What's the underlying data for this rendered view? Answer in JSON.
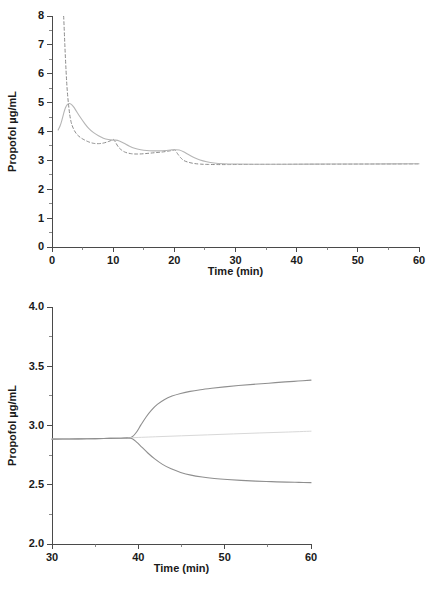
{
  "figure": {
    "background": "#ffffff",
    "width": 427,
    "height": 590
  },
  "chart_data": [
    {
      "id": "panel-a",
      "type": "line",
      "title": "",
      "xlabel": "Time (min)",
      "ylabel": "Propofol µg/mL",
      "xlim": [
        0,
        60
      ],
      "ylim": [
        0,
        8
      ],
      "xticks": [
        0,
        10,
        20,
        30,
        40,
        50,
        60
      ],
      "xtick_labels": [
        "0",
        "10",
        "20",
        "30",
        "40",
        "50",
        "60"
      ],
      "xminor_step": 5,
      "yticks": [
        0,
        1,
        2,
        3,
        4,
        5,
        6,
        7,
        8
      ],
      "ytick_labels": [
        "0",
        "1",
        "2",
        "3",
        "4",
        "5",
        "6",
        "7",
        "8"
      ],
      "yminor_step": 0.5,
      "grid": false,
      "legend": "none",
      "series": [
        {
          "name": "plasma-concentration",
          "style": "dashed",
          "color": "#8c8c8c",
          "dash": "3,2.5",
          "width": 1.0,
          "points": [
            [
              0.6,
              8.6
            ],
            [
              1.0,
              9.4
            ],
            [
              1.3,
              9.6
            ],
            [
              1.6,
              9.0
            ],
            [
              1.9,
              8.0
            ],
            [
              2.1,
              7.0
            ],
            [
              2.3,
              6.1
            ],
            [
              2.5,
              5.4
            ],
            [
              2.8,
              4.75
            ],
            [
              3.1,
              4.35
            ],
            [
              3.5,
              4.1
            ],
            [
              4.0,
              3.92
            ],
            [
              4.6,
              3.8
            ],
            [
              5.2,
              3.72
            ],
            [
              6.0,
              3.64
            ],
            [
              6.8,
              3.59
            ],
            [
              7.6,
              3.58
            ],
            [
              8.4,
              3.6
            ],
            [
              9.2,
              3.65
            ],
            [
              9.8,
              3.7
            ],
            [
              10.1,
              3.72
            ],
            [
              10.4,
              3.62
            ],
            [
              10.8,
              3.48
            ],
            [
              11.3,
              3.37
            ],
            [
              12.0,
              3.28
            ],
            [
              13.0,
              3.23
            ],
            [
              14.0,
              3.22
            ],
            [
              15.0,
              3.23
            ],
            [
              16.0,
              3.25
            ],
            [
              17.0,
              3.27
            ],
            [
              18.0,
              3.29
            ],
            [
              19.0,
              3.32
            ],
            [
              19.8,
              3.35
            ],
            [
              20.1,
              3.36
            ],
            [
              20.5,
              3.24
            ],
            [
              21.0,
              3.1
            ],
            [
              21.6,
              2.99
            ],
            [
              22.4,
              2.93
            ],
            [
              23.3,
              2.89
            ],
            [
              24.3,
              2.87
            ],
            [
              25.5,
              2.86
            ],
            [
              27.0,
              2.855
            ],
            [
              29.0,
              2.855
            ],
            [
              32.0,
              2.86
            ],
            [
              36.0,
              2.862
            ],
            [
              42.0,
              2.866
            ],
            [
              50.0,
              2.872
            ],
            [
              60.0,
              2.88
            ]
          ]
        },
        {
          "name": "effect-site-concentration",
          "style": "solid",
          "color": "#b5b5b5",
          "width": 1.1,
          "points": [
            [
              1.0,
              4.05
            ],
            [
              1.3,
              4.18
            ],
            [
              1.6,
              4.38
            ],
            [
              1.9,
              4.62
            ],
            [
              2.2,
              4.82
            ],
            [
              2.5,
              4.93
            ],
            [
              2.8,
              4.97
            ],
            [
              3.1,
              4.95
            ],
            [
              3.5,
              4.86
            ],
            [
              4.0,
              4.7
            ],
            [
              4.6,
              4.5
            ],
            [
              5.3,
              4.29
            ],
            [
              6.0,
              4.11
            ],
            [
              6.8,
              3.96
            ],
            [
              7.6,
              3.85
            ],
            [
              8.4,
              3.77
            ],
            [
              9.2,
              3.72
            ],
            [
              9.9,
              3.7
            ],
            [
              10.4,
              3.7
            ],
            [
              11.0,
              3.67
            ],
            [
              11.8,
              3.59
            ],
            [
              12.6,
              3.5
            ],
            [
              13.5,
              3.42
            ],
            [
              14.5,
              3.37
            ],
            [
              15.5,
              3.34
            ],
            [
              16.5,
              3.33
            ],
            [
              17.5,
              3.33
            ],
            [
              18.5,
              3.34
            ],
            [
              19.4,
              3.36
            ],
            [
              20.1,
              3.37
            ],
            [
              20.8,
              3.36
            ],
            [
              21.5,
              3.3
            ],
            [
              22.3,
              3.2
            ],
            [
              23.2,
              3.1
            ],
            [
              24.2,
              3.01
            ],
            [
              25.3,
              2.95
            ],
            [
              26.5,
              2.91
            ],
            [
              28.0,
              2.885
            ],
            [
              30.0,
              2.872
            ],
            [
              33.0,
              2.866
            ],
            [
              38.0,
              2.866
            ],
            [
              45.0,
              2.872
            ],
            [
              52.0,
              2.877
            ],
            [
              60.0,
              2.885
            ]
          ]
        }
      ]
    },
    {
      "id": "panel-b",
      "type": "line",
      "title": "",
      "xlabel": "Time (min)",
      "ylabel": "Propofol µg/mL",
      "xlim": [
        30,
        60
      ],
      "ylim": [
        2.0,
        4.0
      ],
      "xticks": [
        30,
        40,
        50,
        60
      ],
      "xtick_labels": [
        "30",
        "40",
        "50",
        "60"
      ],
      "xminor_step": 5,
      "yticks": [
        2.0,
        2.5,
        3.0,
        3.5,
        4.0
      ],
      "ytick_labels": [
        "2.0",
        "2.5",
        "3.0",
        "3.5",
        "4.0"
      ],
      "yminor_step": 0.25,
      "grid": false,
      "legend": "none",
      "series": [
        {
          "name": "upper-bound-concentration",
          "style": "solid",
          "color": "#8f8f8f",
          "width": 1.1,
          "points": [
            [
              30.0,
              2.885
            ],
            [
              32.0,
              2.886
            ],
            [
              34.0,
              2.888
            ],
            [
              36.0,
              2.89
            ],
            [
              38.0,
              2.893
            ],
            [
              38.8,
              2.895
            ],
            [
              39.3,
              2.905
            ],
            [
              39.8,
              2.945
            ],
            [
              40.3,
              3.005
            ],
            [
              40.9,
              3.072
            ],
            [
              41.5,
              3.128
            ],
            [
              42.2,
              3.178
            ],
            [
              43.0,
              3.218
            ],
            [
              43.9,
              3.248
            ],
            [
              44.9,
              3.27
            ],
            [
              46.0,
              3.288
            ],
            [
              47.2,
              3.302
            ],
            [
              48.5,
              3.314
            ],
            [
              50.0,
              3.326
            ],
            [
              51.6,
              3.337
            ],
            [
              53.3,
              3.347
            ],
            [
              55.1,
              3.357
            ],
            [
              57.0,
              3.368
            ],
            [
              58.5,
              3.375
            ],
            [
              60.0,
              3.383
            ]
          ]
        },
        {
          "name": "baseline-concentration",
          "style": "solid",
          "color": "#d8d8d8",
          "width": 1.0,
          "points": [
            [
              30.0,
              2.885
            ],
            [
              34.0,
              2.888
            ],
            [
              38.0,
              2.893
            ],
            [
              39.0,
              2.896
            ],
            [
              42.0,
              2.905
            ],
            [
              45.0,
              2.913
            ],
            [
              48.0,
              2.921
            ],
            [
              51.0,
              2.929
            ],
            [
              54.0,
              2.937
            ],
            [
              57.0,
              2.944
            ],
            [
              60.0,
              2.952
            ]
          ]
        },
        {
          "name": "lower-bound-concentration",
          "style": "solid",
          "color": "#8f8f8f",
          "width": 1.1,
          "points": [
            [
              30.0,
              2.885
            ],
            [
              32.0,
              2.886
            ],
            [
              34.0,
              2.888
            ],
            [
              36.0,
              2.89
            ],
            [
              38.0,
              2.893
            ],
            [
              38.8,
              2.895
            ],
            [
              39.3,
              2.888
            ],
            [
              39.8,
              2.86
            ],
            [
              40.4,
              2.818
            ],
            [
              41.1,
              2.768
            ],
            [
              41.9,
              2.718
            ],
            [
              42.8,
              2.672
            ],
            [
              43.8,
              2.634
            ],
            [
              44.9,
              2.604
            ],
            [
              46.1,
              2.581
            ],
            [
              47.4,
              2.565
            ],
            [
              48.8,
              2.553
            ],
            [
              50.3,
              2.544
            ],
            [
              51.9,
              2.537
            ],
            [
              53.6,
              2.531
            ],
            [
              55.4,
              2.526
            ],
            [
              57.2,
              2.522
            ],
            [
              58.6,
              2.52
            ],
            [
              60.0,
              2.518
            ]
          ]
        }
      ]
    }
  ]
}
